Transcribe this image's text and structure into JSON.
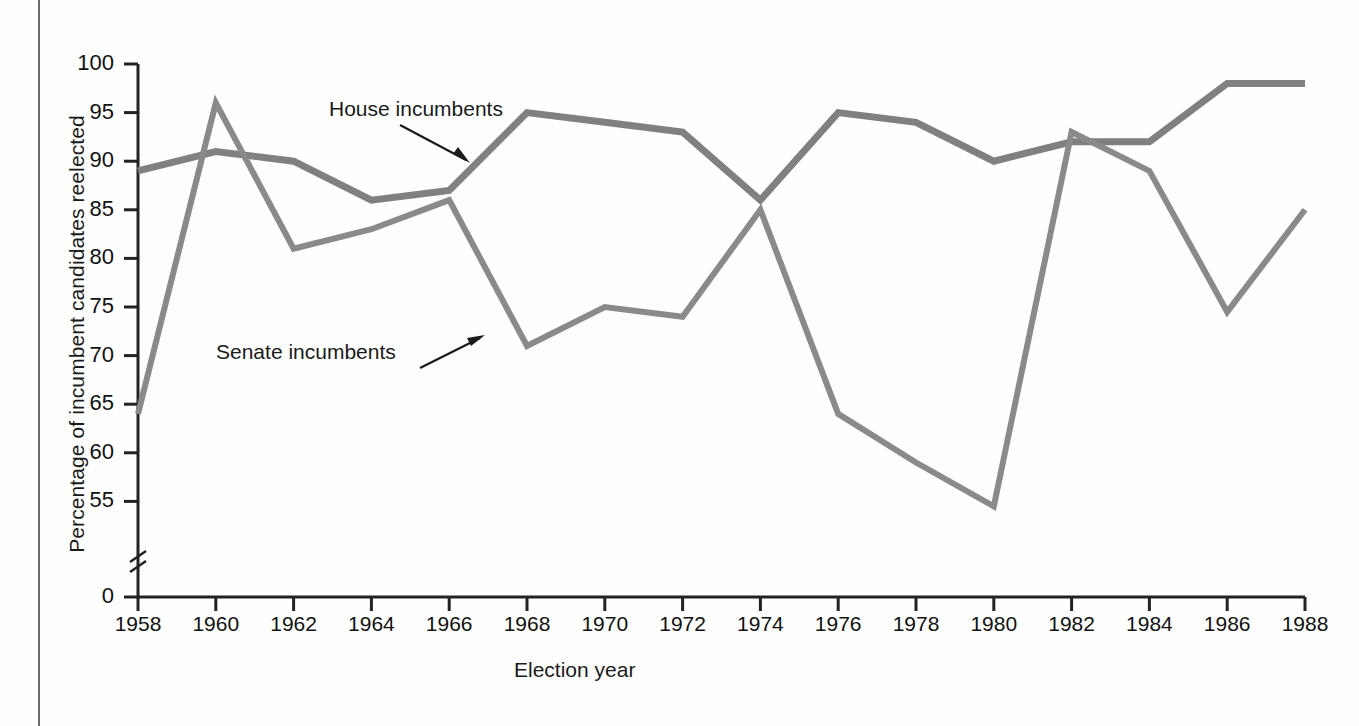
{
  "figure": {
    "background_color": "#fefefe",
    "line_color": "#808080",
    "axis_color": "#222222",
    "text_color": "#1a1a1a"
  },
  "annotations": {
    "house_label": "House incumbents",
    "senate_label": "Senate incumbents"
  },
  "chart_data": {
    "type": "line",
    "title": "",
    "xlabel": "Election year",
    "ylabel": "Percentage of incumbent candidates reelected",
    "categories": [
      1958,
      1960,
      1962,
      1964,
      1966,
      1968,
      1970,
      1972,
      1974,
      1976,
      1978,
      1980,
      1982,
      1984,
      1986,
      1988
    ],
    "xtick_labels": [
      "1958",
      "1960",
      "1962",
      "1964",
      "1966",
      "1968",
      "1970",
      "1972",
      "1974",
      "1976",
      "1978",
      "1980",
      "1982",
      "1984",
      "1986",
      "1988"
    ],
    "ytick_labels": [
      "100",
      "95",
      "90",
      "85",
      "80",
      "75",
      "70",
      "65",
      "60",
      "55",
      "0"
    ],
    "ytick_values": [
      100,
      95,
      90,
      85,
      80,
      75,
      70,
      65,
      60,
      55,
      0
    ],
    "ylim": [
      52,
      100
    ],
    "axis_break": true,
    "axis_break_between": [
      55,
      0
    ],
    "grid": false,
    "legend_position": "inline-annotation",
    "series": [
      {
        "name": "House incumbents",
        "values": [
          89,
          91,
          90,
          86,
          87,
          95,
          94,
          93,
          86,
          95,
          94,
          90,
          92,
          92,
          98,
          98
        ]
      },
      {
        "name": "Senate incumbents",
        "values": [
          64,
          96,
          81,
          83,
          86,
          71,
          75,
          74,
          85,
          64,
          59,
          54.5,
          93,
          89,
          74.5,
          85
        ]
      }
    ]
  }
}
